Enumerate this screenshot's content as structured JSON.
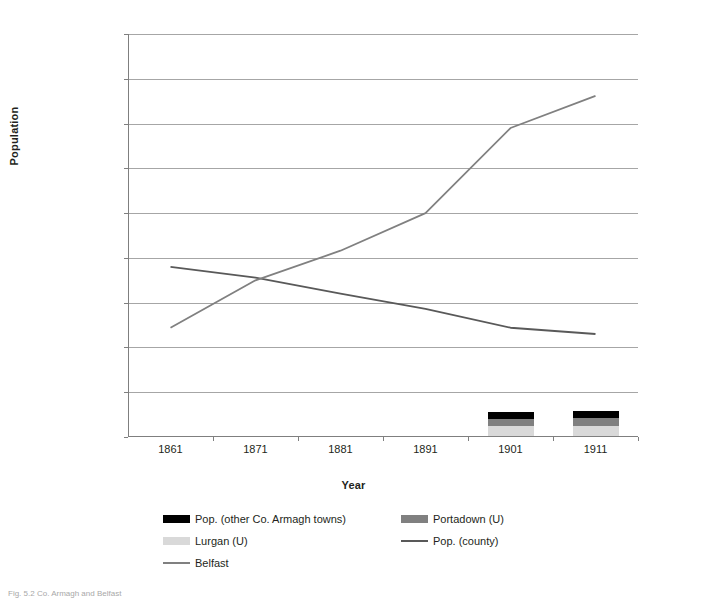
{
  "chart_data": {
    "type": "line",
    "title": "",
    "xlabel": "Year",
    "ylabel": "Population",
    "categories": [
      "1861",
      "1871",
      "1881",
      "1891",
      "1901",
      "1911"
    ],
    "ylim": [
      0,
      450000
    ],
    "ytick_step": 50000,
    "ytick_labels": [
      "0",
      "50,000",
      "100,000",
      "150,000",
      "200,000",
      "250,000",
      "300,000",
      "350,000",
      "400,000",
      "450,000"
    ],
    "ytick_values": [
      0,
      50000,
      100000,
      150000,
      200000,
      250000,
      300000,
      350000,
      400000,
      450000
    ],
    "grid": true,
    "legend_position": "bottom",
    "series": [
      {
        "name": "Pop. (other Co. Armagh towns)",
        "kind": "bar-stacked",
        "color": "#000000",
        "values": [
          null,
          null,
          null,
          null,
          7000,
          7000
        ]
      },
      {
        "name": "Portadown (U)",
        "kind": "bar-stacked",
        "color": "#808080",
        "values": [
          null,
          null,
          null,
          null,
          8000,
          9000
        ]
      },
      {
        "name": "Lurgan (U)",
        "kind": "bar-stacked",
        "color": "#d9d9d9",
        "values": [
          null,
          null,
          null,
          null,
          11500,
          11500
        ]
      },
      {
        "name": "Pop. (county)",
        "kind": "line",
        "color": "#595959",
        "values": [
          190000,
          178000,
          160000,
          143000,
          122000,
          115000
        ]
      },
      {
        "name": "Belfast",
        "kind": "line",
        "color": "#808080",
        "values": [
          122000,
          175000,
          208000,
          250000,
          345000,
          381000
        ]
      }
    ]
  },
  "legend": {
    "items": [
      {
        "label": "Pop. (other Co. Armagh towns)",
        "marker": "box",
        "color": "#000000"
      },
      {
        "label": "Portadown (U)",
        "marker": "box",
        "color": "#808080"
      },
      {
        "label": "Lurgan (U)",
        "marker": "box",
        "color": "#d9d9d9"
      },
      {
        "label": "Pop. (county)",
        "marker": "line",
        "color": "#595959"
      },
      {
        "label": "Belfast",
        "marker": "line",
        "color": "#808080"
      }
    ]
  },
  "caption": {
    "text": "Fig. 5.2 Co. Armagh and Belfast"
  },
  "colors": {
    "grid": "#a6a6a6",
    "axis": "#7f7f7f",
    "text": "#231f20",
    "background": "#ffffff"
  }
}
